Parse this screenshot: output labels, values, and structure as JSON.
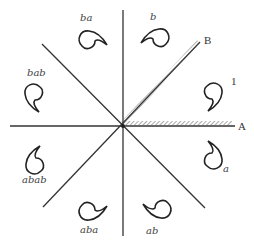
{
  "diagram": {
    "mirror_labels": {
      "A": "A",
      "B": "B"
    },
    "region_label": "1",
    "figures": [
      {
        "id": "identity",
        "label": "",
        "filled": true
      },
      {
        "id": "a",
        "label": "a"
      },
      {
        "id": "ab",
        "label": "ab"
      },
      {
        "id": "aba",
        "label": "aba"
      },
      {
        "id": "abab",
        "label": "abab"
      },
      {
        "id": "bab",
        "label": "bab"
      },
      {
        "id": "ba",
        "label": "ba"
      },
      {
        "id": "b",
        "label": "b"
      }
    ],
    "colors": {
      "line": "#333333",
      "hatch": "#555555",
      "text": "#444444"
    }
  }
}
